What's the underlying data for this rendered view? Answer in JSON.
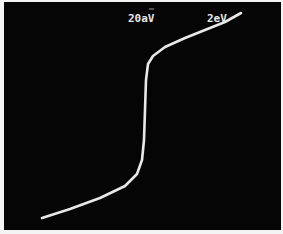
{
  "photo": {
    "subject": "oscilloscope trace of a step/transition curve",
    "background_color": "#050505",
    "trace_color": "#e8e8e8",
    "labels": {
      "left": "20aV",
      "right": "2eV"
    },
    "trace_points": [
      [
        42,
        218
      ],
      [
        70,
        209
      ],
      [
        100,
        198
      ],
      [
        125,
        186
      ],
      [
        137,
        174
      ],
      [
        142,
        160
      ],
      [
        144,
        140
      ],
      [
        145,
        110
      ],
      [
        146,
        80
      ],
      [
        148,
        64
      ],
      [
        153,
        56
      ],
      [
        165,
        47
      ],
      [
        185,
        38
      ],
      [
        205,
        30
      ],
      [
        225,
        22
      ],
      [
        241,
        13
      ]
    ]
  }
}
